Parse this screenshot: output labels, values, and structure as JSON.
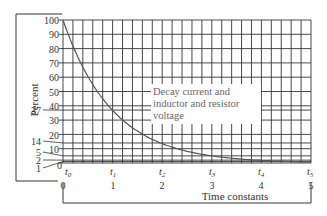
{
  "chart_data": {
    "type": "line",
    "title": "",
    "xlabel": "Time constants",
    "ylabel": "Percent",
    "xlim": [
      0,
      5
    ],
    "ylim": [
      0,
      100
    ],
    "grid": true,
    "x_ticks": [
      0,
      1,
      2,
      3,
      4,
      5
    ],
    "x_tick_labels": [
      "0",
      "1",
      "2",
      "3",
      "4",
      "5"
    ],
    "x_time_labels": [
      "t0",
      "t1",
      "t2",
      "t3",
      "t4",
      "t5"
    ],
    "y_ticks": [
      0,
      10,
      20,
      30,
      40,
      50,
      60,
      70,
      80,
      90,
      100
    ],
    "y_tick_labels": [
      "0",
      "10",
      "20",
      "30",
      "40",
      "50",
      "60",
      "70",
      "80",
      "90",
      "100"
    ],
    "y_marked_values": [
      37,
      14,
      5,
      2,
      1
    ],
    "series": [
      {
        "name": "Decay current and inductor and resistor voltage",
        "x": [
          0,
          0.5,
          1,
          1.5,
          2,
          2.5,
          3,
          3.5,
          4,
          4.5,
          5
        ],
        "values": [
          100,
          61,
          37,
          22,
          14,
          8,
          5,
          3,
          2,
          1,
          1
        ]
      }
    ],
    "annotation": "Decay current and inductor and resistor voltage"
  },
  "labels": {
    "ylabel": "Percent",
    "xlabel": "Time constants",
    "annotation_lines": [
      "Decay current and",
      "inductor and resistor",
      "voltage"
    ],
    "y_ticks": [
      "0",
      "10",
      "20",
      "30",
      "40",
      "50",
      "60",
      "70",
      "80",
      "90",
      "100"
    ],
    "y_marked": [
      "37",
      "14",
      "5",
      "2",
      "1"
    ],
    "x_ticks": [
      "0",
      "1",
      "2",
      "3",
      "4",
      "5"
    ],
    "t_labels": [
      "0",
      "1",
      "2",
      "3",
      "4",
      "5"
    ]
  }
}
